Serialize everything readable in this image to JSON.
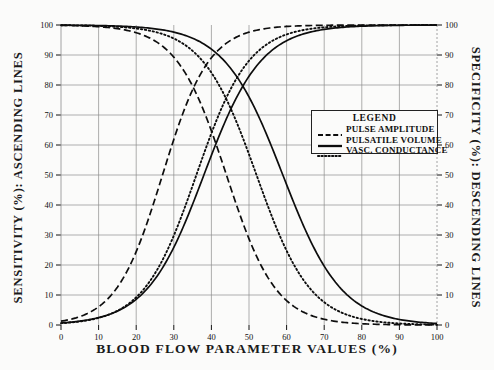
{
  "chart_data": {
    "type": "line",
    "title": "",
    "xlabel": "BLOOD FLOW PARAMETER VALUES (%)",
    "ylabel": "SENSITIVITY (%): ASCENDING LINES",
    "y2label": "SPECIFICITY (%): DESCENDING LINES",
    "xlim": [
      0,
      100
    ],
    "ylim": [
      0,
      100
    ],
    "y2lim": [
      0,
      100
    ],
    "grid": true,
    "legend_position": "center-right",
    "legend_title": "LEGEND",
    "xticks": [
      0,
      10,
      20,
      30,
      40,
      50,
      60,
      70,
      80,
      90,
      100
    ],
    "xticklabels": [
      "0",
      "10",
      "20",
      "30",
      "40",
      "50",
      "60",
      "70",
      "80",
      "90",
      "100"
    ],
    "yticks": [
      0,
      10,
      20,
      30,
      40,
      50,
      60,
      70,
      80,
      90,
      100
    ],
    "yticklabels": [
      "0",
      "10",
      "20",
      "30",
      "40",
      "50",
      "60",
      "70",
      "80",
      "90",
      "100"
    ],
    "y2ticks": [
      0,
      10,
      20,
      30,
      40,
      50,
      60,
      70,
      80,
      90,
      100
    ],
    "y2ticklabels": [
      "0",
      "10",
      "20",
      "30",
      "40",
      "50",
      "60",
      "70",
      "80",
      "90",
      "100"
    ],
    "x": [
      0,
      5,
      10,
      15,
      20,
      25,
      30,
      35,
      40,
      45,
      50,
      55,
      60,
      65,
      70,
      75,
      80,
      85,
      90,
      95,
      100
    ],
    "series": [
      {
        "name": "PULSE AMPLITUDE",
        "style": "dashed",
        "direction": "ascending",
        "axis": "left",
        "midpoint": 27,
        "values": [
          0,
          0.2,
          0.8,
          3,
          8,
          18,
          34,
          54,
          71,
          83,
          90,
          94.5,
          97,
          98.3,
          99.1,
          99.5,
          99.8,
          99.9,
          100,
          100,
          100
        ]
      },
      {
        "name": "PULSATILE VOLUME",
        "style": "solid",
        "direction": "ascending",
        "axis": "left",
        "midpoint": 38,
        "values": [
          0,
          0,
          0.2,
          0.8,
          2.5,
          7,
          15,
          27,
          42,
          57,
          70,
          80,
          87,
          92,
          95.3,
          97.3,
          98.5,
          99.3,
          99.7,
          99.9,
          100
        ]
      },
      {
        "name": "VASC. CONDUCTANCE",
        "style": "dotted",
        "direction": "ascending",
        "axis": "left",
        "midpoint": 36,
        "values": [
          0,
          0,
          0.3,
          1.2,
          3.5,
          9,
          19,
          33,
          49,
          64,
          76,
          85,
          91,
          94.8,
          97,
          98.3,
          99.1,
          99.5,
          99.8,
          100,
          100
        ]
      },
      {
        "name": "PULSE AMPLITUDE",
        "style": "dashed",
        "direction": "descending",
        "axis": "right",
        "midpoint": 44,
        "values": [
          100,
          100,
          100,
          99.9,
          99.6,
          98.5,
          96,
          90,
          80,
          66,
          50,
          34,
          21,
          12,
          6.5,
          3.3,
          1.6,
          0.7,
          0.3,
          0.1,
          0
        ]
      },
      {
        "name": "PULSATILE VOLUME",
        "style": "solid",
        "direction": "descending",
        "axis": "right",
        "midpoint": 59,
        "values": [
          100,
          100,
          100,
          100,
          100,
          99.9,
          99.5,
          98.3,
          96,
          91.5,
          84,
          73,
          59,
          44,
          30,
          19,
          11,
          5.8,
          2.6,
          0.9,
          0
        ]
      },
      {
        "name": "VASC. CONDUCTANCE",
        "style": "dotted",
        "direction": "descending",
        "axis": "right",
        "midpoint": 52,
        "values": [
          100,
          100,
          100,
          100,
          99.8,
          99.3,
          98,
          95,
          89.5,
          80,
          67,
          52,
          37,
          24,
          14.5,
          8,
          4,
          1.8,
          0.7,
          0.2,
          0
        ]
      }
    ],
    "legend_entries": [
      {
        "label": "PULSE AMPLITUDE",
        "style": "dashed"
      },
      {
        "label": "PULSATILE VOLUME",
        "style": "solid"
      },
      {
        "label": "VASC. CONDUCTANCE",
        "style": "dotted"
      }
    ]
  }
}
